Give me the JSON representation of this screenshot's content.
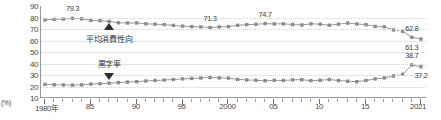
{
  "chart_data": {
    "type": "line",
    "title": "",
    "xlabel": "",
    "ylabel": "(%)",
    "ylim": [
      10,
      90
    ],
    "ytick_values": [
      90,
      80,
      70,
      60,
      50,
      40,
      30,
      20,
      10
    ],
    "xlim": [
      1980,
      2021
    ],
    "grid": true,
    "legend": "none",
    "x": [
      1980,
      1981,
      1982,
      1983,
      1984,
      1985,
      1986,
      1987,
      1988,
      1989,
      1990,
      1991,
      1992,
      1993,
      1994,
      1995,
      1996,
      1997,
      1998,
      1999,
      2000,
      2001,
      2002,
      2003,
      2004,
      2005,
      2006,
      2007,
      2008,
      2009,
      2010,
      2011,
      2012,
      2013,
      2014,
      2015,
      2016,
      2017,
      2018,
      2019,
      2020,
      2021
    ],
    "xtick_labels": [
      "1980年",
      "85",
      "90",
      "95",
      "2000",
      "05",
      "10",
      "15",
      "2021"
    ],
    "xtick_positions": [
      1980,
      1985,
      1990,
      1995,
      2000,
      2005,
      2010,
      2015,
      2021
    ],
    "series": [
      {
        "name": "平均消費性向",
        "color": "#8c8c8c",
        "values": [
          77.9,
          78.4,
          78.6,
          79.3,
          78.8,
          77.5,
          77.2,
          76.6,
          75.4,
          75.2,
          75.3,
          74.5,
          74.2,
          73.8,
          73.1,
          72.5,
          72.1,
          71.8,
          71.3,
          71.8,
          72.1,
          73.2,
          73.8,
          74.1,
          74.7,
          74.4,
          74.5,
          73.9,
          73.5,
          74.5,
          74.2,
          73.3,
          74.2,
          75.1,
          74.4,
          73.8,
          72.2,
          71.9,
          69.2,
          67.9,
          62.8,
          61.3
        ]
      },
      {
        "name": "黒字率",
        "color": "#8c8c8c",
        "values": [
          21.9,
          21.5,
          21.4,
          21.2,
          21.4,
          22.1,
          22.4,
          22.9,
          23.4,
          23.9,
          24.2,
          24.8,
          25.2,
          25.6,
          26.1,
          26.6,
          27.0,
          27.4,
          27.8,
          27.5,
          27.3,
          26.2,
          25.7,
          25.4,
          25.0,
          25.4,
          25.2,
          25.8,
          25.9,
          25.1,
          25.4,
          26.1,
          25.2,
          24.6,
          24.2,
          25.2,
          26.6,
          27.4,
          29.2,
          30.6,
          38.7,
          37.2
        ]
      }
    ],
    "data_labels": [
      {
        "text": "79.3",
        "x": 1983,
        "series": 0,
        "dy": -9
      },
      {
        "text": "71.3",
        "x": 1998,
        "series": 0,
        "dy": -9
      },
      {
        "text": "74.7",
        "x": 2004,
        "series": 0,
        "dy": -9
      },
      {
        "text": "62.8",
        "x": 2020,
        "series": 0,
        "dy": -8
      },
      {
        "text": "61.3",
        "x": 2020,
        "series": 0,
        "dy": 11
      },
      {
        "text": "38.7",
        "x": 2020,
        "series": 1,
        "dy": -9
      },
      {
        "text": "37.2",
        "x": 2021,
        "series": 1,
        "dy": 9
      }
    ],
    "annotations": [
      {
        "text": "平均消費性向",
        "x": 1987,
        "y": 62.5,
        "marker": "triangle-up",
        "marker_y": 72.5
      },
      {
        "text": "黒字率",
        "x": 1987,
        "y": 40.5,
        "marker": "triangle-down",
        "marker_y": 29.5
      }
    ],
    "dashed_segments": [
      {
        "series": 0,
        "from": 2018,
        "to": 2019
      },
      {
        "series": 1,
        "from": 2018,
        "to": 2019
      }
    ]
  }
}
